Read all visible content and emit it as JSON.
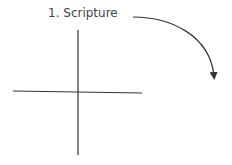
{
  "diagram": {
    "label": "1. Scripture",
    "colors": {
      "line": "#333333",
      "text": "#444444",
      "background": "#ffffff"
    },
    "cross": {
      "vertical": {
        "x": 78,
        "y1": 30,
        "y2": 155
      },
      "horizontal": {
        "y1": 91,
        "y2": 93,
        "x1": 13,
        "x2": 142
      }
    },
    "arrow": {
      "start": [
        133,
        17
      ],
      "end": [
        215,
        80
      ],
      "direction": "clockwise-down"
    }
  }
}
